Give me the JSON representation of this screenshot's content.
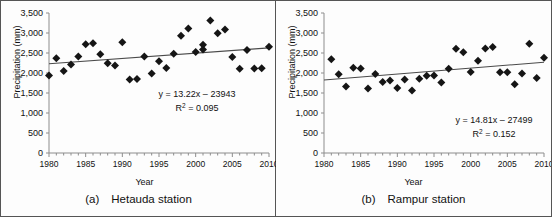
{
  "figure": {
    "panels": [
      {
        "id": "hetauda",
        "caption_tag": "(a)",
        "caption_label": "Hetauda station",
        "equation": "y = 13.22x – 23943",
        "r2_prefix": "R",
        "r2_sup": "2",
        "r2_value": " = 0.095"
      },
      {
        "id": "rampur",
        "caption_tag": "(b)",
        "caption_label": "Rampur station",
        "equation": "y = 14.81x – 27499",
        "r2_prefix": "R",
        "r2_sup": "2",
        "r2_value": " = 0.152"
      }
    ]
  },
  "chart_data": [
    {
      "type": "scatter",
      "id": "hetauda",
      "title": "(a)  Hetauda station",
      "xlabel": "Year",
      "ylabel": "Precipitation (mm)",
      "xlim": [
        1980,
        2010
      ],
      "ylim": [
        0,
        3500
      ],
      "ytick_labels": [
        "0",
        "500",
        "1,000",
        "1,500",
        "2,000",
        "2,500",
        "3,000",
        "3,500"
      ],
      "ytick_values": [
        0,
        500,
        1000,
        1500,
        2000,
        2500,
        3000,
        3500
      ],
      "xtick_labels": [
        "1980",
        "1985",
        "1990",
        "1995",
        "2000",
        "2005",
        "2010"
      ],
      "xtick_values": [
        1980,
        1985,
        1990,
        1995,
        2000,
        2005,
        2010
      ],
      "xminor_step": 1,
      "grid": false,
      "legend": "none",
      "marker": "diamond",
      "marker_color": "#151515",
      "trendline": {
        "equation": "y = 13.22x – 23943",
        "slope": 13.22,
        "intercept": -23943,
        "r2": 0.095,
        "r2_label": "R² = 0.095",
        "x_start": 1980,
        "x_end": 2010,
        "y_start": 2232,
        "y_end": 2629
      },
      "points": [
        {
          "x": 1980,
          "y": 1940
        },
        {
          "x": 1981,
          "y": 2370
        },
        {
          "x": 1982,
          "y": 2050
        },
        {
          "x": 1983,
          "y": 2215
        },
        {
          "x": 1984,
          "y": 2410
        },
        {
          "x": 1985,
          "y": 2720
        },
        {
          "x": 1986,
          "y": 2745
        },
        {
          "x": 1987,
          "y": 2470
        },
        {
          "x": 1988,
          "y": 2245
        },
        {
          "x": 1989,
          "y": 2185
        },
        {
          "x": 1990,
          "y": 2770
        },
        {
          "x": 1991,
          "y": 1835
        },
        {
          "x": 1992,
          "y": 1850
        },
        {
          "x": 1993,
          "y": 2415
        },
        {
          "x": 1994,
          "y": 1990
        },
        {
          "x": 1995,
          "y": 2295
        },
        {
          "x": 1996,
          "y": 2125
        },
        {
          "x": 1997,
          "y": 2480
        },
        {
          "x": 1998,
          "y": 2930
        },
        {
          "x": 1999,
          "y": 3115
        },
        {
          "x": 2000,
          "y": 2525
        },
        {
          "x": 2001,
          "y": 2590
        },
        {
          "x": 2002,
          "y": 3310
        },
        {
          "x": 2003,
          "y": 2995
        },
        {
          "x": 2004,
          "y": 3090
        },
        {
          "x": 2005,
          "y": 2400
        },
        {
          "x": 2006,
          "y": 2105
        },
        {
          "x": 2007,
          "y": 2575
        },
        {
          "x": 2008,
          "y": 2115
        },
        {
          "x": 2009,
          "y": 2120
        },
        {
          "x": 2010,
          "y": 2655
        },
        {
          "x": 2001,
          "y": 2705
        }
      ]
    },
    {
      "type": "scatter",
      "id": "rampur",
      "title": "(b)  Rampur station",
      "xlabel": "Year",
      "ylabel": "Precipitation (mm)",
      "xlim": [
        1980,
        2010
      ],
      "ylim": [
        0,
        3500
      ],
      "ytick_labels": [
        "0",
        "500",
        "1,000",
        "1,500",
        "2,000",
        "2,500",
        "3,000",
        "3,500"
      ],
      "ytick_values": [
        0,
        500,
        1000,
        1500,
        2000,
        2500,
        3000,
        3500
      ],
      "xtick_labels": [
        "1980",
        "1985",
        "1990",
        "1995",
        "2000",
        "2005",
        "2010"
      ],
      "xtick_values": [
        1980,
        1985,
        1990,
        1995,
        2000,
        2005,
        2010
      ],
      "xminor_step": 1,
      "grid": false,
      "legend": "none",
      "marker": "diamond",
      "marker_color": "#151515",
      "trendline": {
        "equation": "y = 14.81x – 27499",
        "slope": 14.81,
        "intercept": -27499,
        "r2": 0.152,
        "r2_label": "R² = 0.152",
        "x_start": 1980,
        "x_end": 2010,
        "y_start": 1825,
        "y_end": 2270
      },
      "points": [
        {
          "x": 1981,
          "y": 2345
        },
        {
          "x": 1982,
          "y": 1970
        },
        {
          "x": 1983,
          "y": 1660
        },
        {
          "x": 1984,
          "y": 2130
        },
        {
          "x": 1985,
          "y": 2110
        },
        {
          "x": 1986,
          "y": 1615
        },
        {
          "x": 1987,
          "y": 1975
        },
        {
          "x": 1988,
          "y": 1775
        },
        {
          "x": 1989,
          "y": 1810
        },
        {
          "x": 1990,
          "y": 1625
        },
        {
          "x": 1991,
          "y": 1840
        },
        {
          "x": 1992,
          "y": 1565
        },
        {
          "x": 1993,
          "y": 1855
        },
        {
          "x": 1994,
          "y": 1930
        },
        {
          "x": 1995,
          "y": 1940
        },
        {
          "x": 1996,
          "y": 1760
        },
        {
          "x": 1997,
          "y": 2105
        },
        {
          "x": 1998,
          "y": 2605
        },
        {
          "x": 1999,
          "y": 2520
        },
        {
          "x": 2000,
          "y": 2025
        },
        {
          "x": 2001,
          "y": 2305
        },
        {
          "x": 2002,
          "y": 2615
        },
        {
          "x": 2003,
          "y": 2650
        },
        {
          "x": 2004,
          "y": 2020
        },
        {
          "x": 2005,
          "y": 2020
        },
        {
          "x": 2006,
          "y": 1720
        },
        {
          "x": 2007,
          "y": 1990
        },
        {
          "x": 2008,
          "y": 2730
        },
        {
          "x": 2009,
          "y": 1875
        },
        {
          "x": 2010,
          "y": 2380
        }
      ]
    }
  ]
}
